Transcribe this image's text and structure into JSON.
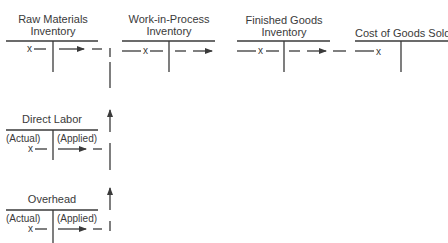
{
  "accounts": {
    "raw_materials": {
      "title_line1": "Raw Materials",
      "title_line2": "Inventory",
      "entry_mark": "x"
    },
    "wip": {
      "title_line1": "Work-in-Process",
      "title_line2": "Inventory",
      "entry_mark": "x"
    },
    "finished_goods": {
      "title_line1": "Finished Goods",
      "title_line2": "Inventory",
      "entry_mark": "x"
    },
    "cogs": {
      "title": "Cost of Goods Sold",
      "entry_mark": "x"
    },
    "direct_labor": {
      "title": "Direct Labor",
      "left_label": "(Actual)",
      "right_label": "(Applied)",
      "entry_mark": "x"
    },
    "overhead": {
      "title": "Overhead",
      "left_label": "(Actual)",
      "right_label": "(Applied)",
      "entry_mark": "x"
    }
  },
  "colors": {
    "ink": "#3a3a3a"
  }
}
